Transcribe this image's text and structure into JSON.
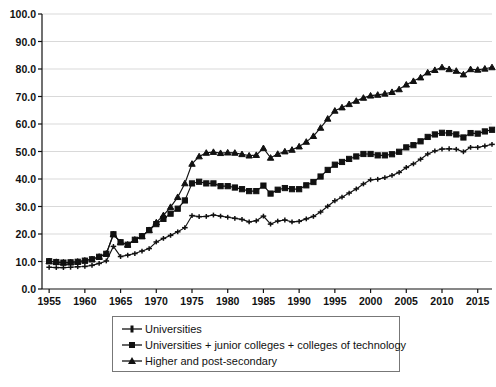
{
  "legend": {
    "position": "below-axis",
    "entries": [
      {
        "label": "Universities",
        "marker": "plus-marker"
      },
      {
        "label": "Universities + junior colleges + colleges of technology",
        "marker": "square-marker"
      },
      {
        "label": "Higher and post-secondary",
        "marker": "triangle-marker"
      }
    ]
  },
  "chart_data": {
    "type": "line",
    "title": "",
    "xlabel": "",
    "ylabel": "",
    "xlim": [
      1954,
      2017
    ],
    "ylim": [
      0,
      100
    ],
    "grid": true,
    "legend_position": "bottom",
    "xtick_labels": [
      "1955",
      "1960",
      "1965",
      "1970",
      "1975",
      "1980",
      "1985",
      "1990",
      "1995",
      "2000",
      "2005",
      "2010",
      "2015"
    ],
    "xtick_values": [
      1955,
      1960,
      1965,
      1970,
      1975,
      1980,
      1985,
      1990,
      1995,
      2000,
      2005,
      2010,
      2015
    ],
    "ytick_labels": [
      "0.0",
      "10.0",
      "20.0",
      "30.0",
      "40.0",
      "50.0",
      "60.0",
      "70.0",
      "80.0",
      "90.0",
      "100.0"
    ],
    "ytick_values": [
      0,
      10,
      20,
      30,
      40,
      50,
      60,
      70,
      80,
      90,
      100
    ],
    "x": [
      1955,
      1956,
      1957,
      1958,
      1959,
      1960,
      1961,
      1962,
      1963,
      1964,
      1965,
      1966,
      1967,
      1968,
      1969,
      1970,
      1971,
      1972,
      1973,
      1974,
      1975,
      1976,
      1977,
      1978,
      1979,
      1980,
      1981,
      1982,
      1983,
      1984,
      1985,
      1986,
      1987,
      1988,
      1989,
      1990,
      1991,
      1992,
      1993,
      1994,
      1995,
      1996,
      1997,
      1998,
      1999,
      2000,
      2001,
      2002,
      2003,
      2004,
      2005,
      2006,
      2007,
      2008,
      2009,
      2010,
      2011,
      2012,
      2013,
      2014,
      2015,
      2016,
      2017
    ],
    "series": [
      {
        "name": "Universities",
        "marker": "plus-marker",
        "values": [
          7.9,
          7.8,
          7.8,
          7.9,
          8.1,
          8.2,
          8.6,
          9.3,
          10.2,
          15.5,
          11.8,
          12.3,
          12.9,
          13.8,
          14.7,
          17.1,
          18.4,
          19.5,
          20.8,
          22.3,
          26.7,
          26.3,
          26.4,
          26.9,
          26.5,
          26.1,
          25.7,
          25.3,
          24.4,
          24.8,
          26.5,
          23.6,
          24.7,
          25.1,
          24.4,
          24.6,
          25.5,
          26.4,
          28.0,
          30.1,
          32.1,
          33.4,
          34.9,
          36.4,
          38.2,
          39.7,
          39.9,
          40.5,
          41.3,
          42.4,
          44.2,
          45.5,
          47.2,
          49.1,
          50.2,
          50.9,
          51.0,
          50.8,
          49.9,
          51.5,
          51.5,
          52.0,
          52.6
        ]
      },
      {
        "name": "Universities + junior colleges + colleges of technology",
        "marker": "square-marker",
        "values": [
          10.1,
          9.8,
          9.6,
          9.7,
          9.9,
          10.3,
          10.8,
          11.7,
          12.8,
          19.9,
          17.0,
          16.1,
          17.9,
          19.2,
          21.4,
          23.6,
          25.5,
          27.4,
          29.2,
          32.2,
          38.4,
          39.0,
          38.4,
          38.4,
          37.4,
          37.4,
          36.9,
          36.3,
          35.6,
          35.6,
          37.6,
          34.7,
          36.1,
          36.7,
          36.3,
          36.3,
          37.7,
          38.9,
          40.9,
          43.3,
          45.2,
          46.2,
          47.3,
          48.2,
          49.1,
          49.1,
          48.6,
          48.6,
          49.0,
          49.9,
          51.5,
          52.3,
          53.7,
          55.3,
          56.2,
          56.8,
          56.7,
          56.2,
          55.1,
          56.7,
          56.5,
          57.3,
          57.9
        ]
      },
      {
        "name": "Higher and post-secondary",
        "marker": "triangle-marker",
        "values": [
          10.1,
          9.8,
          9.6,
          9.7,
          9.9,
          10.3,
          10.8,
          11.7,
          12.8,
          19.9,
          17.0,
          16.1,
          17.9,
          19.2,
          21.4,
          24.2,
          26.8,
          29.8,
          33.4,
          38.4,
          45.5,
          48.2,
          49.5,
          49.8,
          49.4,
          49.6,
          49.5,
          49.0,
          48.5,
          48.7,
          51.2,
          47.7,
          49.1,
          50.0,
          50.6,
          51.8,
          53.5,
          55.6,
          58.6,
          61.9,
          64.8,
          66.0,
          67.2,
          68.4,
          69.5,
          70.3,
          70.6,
          71.0,
          71.6,
          72.6,
          74.3,
          75.6,
          76.9,
          78.7,
          79.6,
          80.6,
          79.9,
          79.3,
          78.0,
          79.9,
          79.7,
          80.1,
          80.6
        ]
      }
    ]
  }
}
